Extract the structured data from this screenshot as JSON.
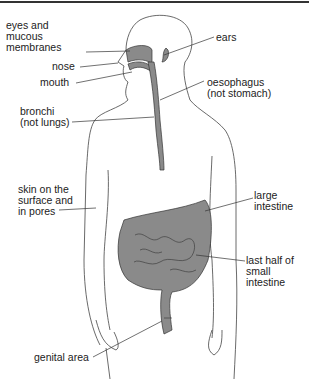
{
  "diagram": {
    "fill_color": "#8a8a8a",
    "line_color": "#333333",
    "labels": {
      "eyes": "eyes and\nmucous\nmembranes",
      "nose": "nose",
      "mouth": "mouth",
      "bronchi": "bronchi\n(not lungs)",
      "skin": "skin on the\nsurface and\nin pores",
      "ears": "ears",
      "oesophagus": "oesophagus\n(not stomach)",
      "large_intestine": "large\nintestine",
      "small_intestine": "last half of\nsmall\nintestine",
      "genital": "genital area"
    }
  }
}
